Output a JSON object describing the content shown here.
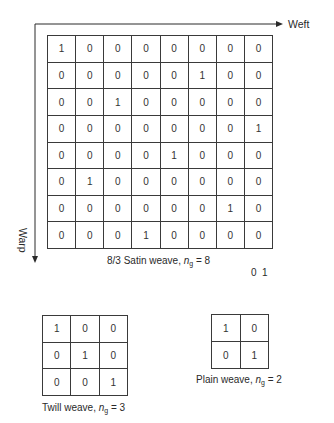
{
  "axes": {
    "x_label": "Weft",
    "y_label": "Warp",
    "line_color": "#2a2a2a"
  },
  "satin": {
    "caption_prefix": "8/3 Satin weave, ",
    "caption_var": "n",
    "caption_sub": "g",
    "caption_suffix": " = 8",
    "rows": 8,
    "cols": 8,
    "matrix": [
      [
        1,
        0,
        0,
        0,
        0,
        0,
        0,
        0
      ],
      [
        0,
        0,
        0,
        0,
        0,
        1,
        0,
        0
      ],
      [
        0,
        0,
        1,
        0,
        0,
        0,
        0,
        0
      ],
      [
        0,
        0,
        0,
        0,
        0,
        0,
        0,
        1
      ],
      [
        0,
        0,
        0,
        0,
        1,
        0,
        0,
        0
      ],
      [
        0,
        1,
        0,
        0,
        0,
        0,
        0,
        0
      ],
      [
        0,
        0,
        0,
        0,
        0,
        0,
        1,
        0
      ],
      [
        0,
        0,
        0,
        1,
        0,
        0,
        0,
        0
      ]
    ]
  },
  "legend_values": "0  1",
  "twill": {
    "caption_prefix": "Twill weave, ",
    "caption_var": "n",
    "caption_sub": "g",
    "caption_suffix": " = 3",
    "rows": 3,
    "cols": 3,
    "matrix": [
      [
        1,
        0,
        0
      ],
      [
        0,
        1,
        0
      ],
      [
        0,
        0,
        1
      ]
    ]
  },
  "plain": {
    "caption_prefix": "Plain weave, ",
    "caption_var": "n",
    "caption_sub": "g",
    "caption_suffix": " = 2",
    "rows": 2,
    "cols": 2,
    "matrix": [
      [
        1,
        0
      ],
      [
        0,
        1
      ]
    ]
  }
}
